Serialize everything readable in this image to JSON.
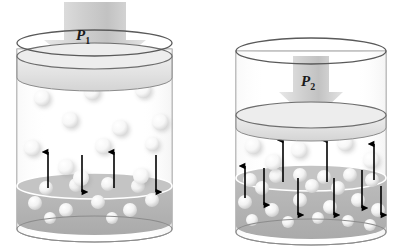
{
  "figure": {
    "background_color": "#ffffff",
    "outline_color": "#808080",
    "liquid_color": "#b3b3b3",
    "piston_color": "#e0e0e0",
    "molecule_color": "#ffffff",
    "arrow_color": "#000000",
    "pressure_arrow_color": "#cccccc"
  },
  "panels": [
    {
      "id": "left",
      "name": "low-pressure-container",
      "pressure_label": "P",
      "pressure_subscript": "1",
      "pressure_arrow": {
        "position": "above-container",
        "size": "large",
        "direction": "down"
      },
      "cylinder": {
        "x": 17,
        "top": 36,
        "bottom": 229,
        "width": 155,
        "ellipse_ry": 13
      },
      "piston": {
        "top": 56,
        "height": 22,
        "label": "gas-piston-lid"
      },
      "liquid": {
        "surface_y": 186,
        "bottom_y": 222,
        "fill": "#b3b3b3"
      },
      "gas_molecules": [
        {
          "x": 42,
          "y": 98,
          "r": 8
        },
        {
          "x": 92,
          "y": 92,
          "r": 8
        },
        {
          "x": 143,
          "y": 90,
          "r": 8
        },
        {
          "x": 70,
          "y": 120,
          "r": 8
        },
        {
          "x": 120,
          "y": 128,
          "r": 8
        },
        {
          "x": 160,
          "y": 122,
          "r": 8
        },
        {
          "x": 32,
          "y": 148,
          "r": 8
        },
        {
          "x": 103,
          "y": 146,
          "r": 8
        },
        {
          "x": 152,
          "y": 144,
          "r": 7
        },
        {
          "x": 66,
          "y": 167,
          "r": 8
        },
        {
          "x": 81,
          "y": 178,
          "r": 8
        },
        {
          "x": 141,
          "y": 176,
          "r": 8
        }
      ],
      "surface_molecules": [
        {
          "x": 46,
          "y": 188,
          "r": 7
        },
        {
          "x": 76,
          "y": 185,
          "r": 7
        },
        {
          "x": 108,
          "y": 184,
          "r": 7
        },
        {
          "x": 138,
          "y": 186,
          "r": 7
        }
      ],
      "dissolved_molecules": [
        {
          "x": 35,
          "y": 203,
          "r": 7
        },
        {
          "x": 66,
          "y": 210,
          "r": 7
        },
        {
          "x": 98,
          "y": 202,
          "r": 7
        },
        {
          "x": 130,
          "y": 210,
          "r": 7
        },
        {
          "x": 152,
          "y": 200,
          "r": 7
        },
        {
          "x": 50,
          "y": 218,
          "r": 6
        },
        {
          "x": 112,
          "y": 218,
          "r": 6
        }
      ],
      "arrows_up": [
        {
          "x": 48,
          "y1": 188,
          "y2": 152
        },
        {
          "x": 114,
          "y1": 188,
          "y2": 152
        }
      ],
      "arrows_down": [
        {
          "x": 82,
          "y1": 155,
          "y2": 192
        },
        {
          "x": 156,
          "y1": 155,
          "y2": 192
        }
      ],
      "up_arrow_count": 2,
      "down_arrow_count": 2,
      "gas_molecule_count": 12,
      "dissolved_molecule_count": 7
    },
    {
      "id": "right",
      "name": "high-pressure-container",
      "pressure_label": "P",
      "pressure_subscript": "2",
      "pressure_arrow": {
        "position": "inside-container",
        "size": "medium",
        "direction": "down"
      },
      "cylinder": {
        "x": 236,
        "top": 38,
        "bottom": 232,
        "width": 150,
        "ellipse_ry": 13
      },
      "piston": {
        "top": 102,
        "height": 24,
        "label": "gas-piston-lid"
      },
      "liquid": {
        "surface_y": 178,
        "bottom_y": 226,
        "fill": "#b3b3b3"
      },
      "gas_molecules": [
        {
          "x": 253,
          "y": 146,
          "r": 8
        },
        {
          "x": 299,
          "y": 150,
          "r": 8
        },
        {
          "x": 345,
          "y": 143,
          "r": 8
        },
        {
          "x": 273,
          "y": 162,
          "r": 8
        },
        {
          "x": 371,
          "y": 160,
          "r": 8
        }
      ],
      "surface_molecules": [
        {
          "x": 250,
          "y": 180,
          "r": 7
        },
        {
          "x": 276,
          "y": 176,
          "r": 7
        },
        {
          "x": 300,
          "y": 175,
          "r": 7
        },
        {
          "x": 324,
          "y": 177,
          "r": 7
        },
        {
          "x": 350,
          "y": 175,
          "r": 7
        },
        {
          "x": 372,
          "y": 180,
          "r": 7
        },
        {
          "x": 262,
          "y": 188,
          "r": 7
        },
        {
          "x": 312,
          "y": 186,
          "r": 7
        },
        {
          "x": 338,
          "y": 188,
          "r": 7
        }
      ],
      "dissolved_molecules": [
        {
          "x": 245,
          "y": 202,
          "r": 7
        },
        {
          "x": 272,
          "y": 210,
          "r": 7
        },
        {
          "x": 300,
          "y": 200,
          "r": 7
        },
        {
          "x": 330,
          "y": 207,
          "r": 7
        },
        {
          "x": 358,
          "y": 200,
          "r": 7
        },
        {
          "x": 378,
          "y": 210,
          "r": 7
        },
        {
          "x": 252,
          "y": 220,
          "r": 6
        },
        {
          "x": 288,
          "y": 222,
          "r": 6
        },
        {
          "x": 318,
          "y": 218,
          "r": 6
        },
        {
          "x": 348,
          "y": 221,
          "r": 6
        },
        {
          "x": 370,
          "y": 225,
          "r": 6
        }
      ],
      "arrows_up": [
        {
          "x": 245,
          "y1": 198,
          "y2": 166
        },
        {
          "x": 283,
          "y1": 182,
          "y2": 140
        },
        {
          "x": 327,
          "y1": 182,
          "y2": 140
        },
        {
          "x": 374,
          "y1": 180,
          "y2": 144
        }
      ],
      "arrows_down": [
        {
          "x": 264,
          "y1": 168,
          "y2": 205
        },
        {
          "x": 298,
          "y1": 178,
          "y2": 215
        },
        {
          "x": 334,
          "y1": 178,
          "y2": 215
        },
        {
          "x": 362,
          "y1": 170,
          "y2": 208
        },
        {
          "x": 381,
          "y1": 186,
          "y2": 215
        }
      ],
      "up_arrow_count": 4,
      "down_arrow_count": 5,
      "gas_molecule_count": 5,
      "dissolved_molecule_count": 11
    }
  ]
}
